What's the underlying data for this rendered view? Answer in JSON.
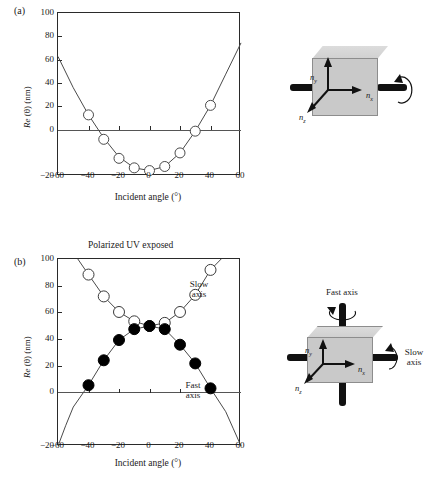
{
  "figure": {
    "panel_a_letter": "(a)",
    "panel_b_letter": "(b)",
    "panel_b_title": "Polarized UV exposed"
  },
  "chart_data": [
    {
      "type": "scatter",
      "panel": "(a)",
      "title": "",
      "xlabel": "Incident angle (°)",
      "ylabel": "Re (θ) (nm)",
      "xlim": [
        -60,
        60
      ],
      "ylim": [
        -20,
        100
      ],
      "xticks": [
        -60,
        -40,
        -20,
        0,
        20,
        40,
        60
      ],
      "yticks": [
        -20,
        0,
        20,
        40,
        60,
        80,
        100
      ],
      "grid": false,
      "legend": "none",
      "series": [
        {
          "name": "Unexposed retardation",
          "marker": "open-circle",
          "x": [
            -40,
            -30,
            -20,
            -10,
            0,
            10,
            20,
            30,
            40
          ],
          "values": [
            25,
            7,
            -7,
            -14,
            -16,
            -13,
            -3,
            13,
            32
          ]
        }
      ],
      "fit_curve": {
        "name": "parabolic fit",
        "x": [
          -60,
          -50,
          -40,
          -30,
          -20,
          -10,
          0,
          10,
          20,
          30,
          40,
          50,
          60
        ],
        "values": [
          68,
          45,
          25,
          8,
          -6,
          -14,
          -16,
          -13,
          -3,
          13,
          32,
          55,
          78
        ]
      }
    },
    {
      "type": "scatter",
      "panel": "(b)",
      "title": "Polarized UV exposed",
      "xlabel": "Incident angle (°)",
      "ylabel": "Re (θ) (nm)",
      "xlim": [
        -60,
        60
      ],
      "ylim": [
        -20,
        100
      ],
      "xticks": [
        -60,
        -40,
        -20,
        0,
        20,
        40,
        60
      ],
      "yticks": [
        -20,
        0,
        20,
        40,
        60,
        80,
        100
      ],
      "grid": false,
      "legend": "inline-annotations",
      "annotations": [
        {
          "text": "Slow\naxis",
          "x": 28,
          "y": 86
        },
        {
          "text": "Fast\naxis",
          "x": 27,
          "y": 22
        }
      ],
      "series": [
        {
          "name": "Slow axis",
          "marker": "open-circle",
          "x": [
            -40,
            -30,
            -20,
            -10,
            0,
            10,
            20,
            30,
            40
          ],
          "values": [
            90,
            76,
            66,
            60,
            57,
            59,
            66,
            77,
            93
          ]
        },
        {
          "name": "Fast axis",
          "marker": "filled-circle",
          "x": [
            -40,
            -30,
            -20,
            -10,
            0,
            10,
            20,
            30,
            40
          ],
          "values": [
            19,
            35,
            48,
            55,
            57,
            55,
            45,
            33,
            17
          ]
        }
      ],
      "fit_curves": [
        {
          "name": "Slow axis fit",
          "x": [
            -47,
            -40,
            -30,
            -20,
            -10,
            0,
            10,
            20,
            30,
            40,
            47
          ],
          "values": [
            100,
            90,
            76,
            66,
            60,
            57,
            59,
            66,
            77,
            93,
            100
          ]
        },
        {
          "name": "Fast axis fit",
          "x": [
            -60,
            -55,
            -50,
            -40,
            -30,
            -20,
            -10,
            0,
            10,
            20,
            30,
            40,
            50,
            55,
            60
          ],
          "values": [
            -20,
            -7,
            5,
            19,
            35,
            48,
            55,
            57,
            55,
            45,
            33,
            17,
            2,
            -9,
            -20
          ]
        }
      ]
    }
  ],
  "diagram_a": {
    "name": "unexposed-film-axes",
    "axis_labels": [
      "n_y",
      "n_x",
      "n_z"
    ],
    "n_y": "n",
    "n_y_sub": "y",
    "n_x": "n",
    "n_x_sub": "x",
    "n_z": "n",
    "n_z_sub": "z",
    "rotation": "rotation-arrow"
  },
  "diagram_b": {
    "name": "exposed-film-axes",
    "fast_axis_label": "Fast axis",
    "slow_axis_label": "Slow\naxis",
    "slow_axis_line1": "Slow",
    "slow_axis_line2": "axis",
    "n_y": "n",
    "n_y_sub": "y",
    "n_x": "n",
    "n_x_sub": "x",
    "n_z": "n",
    "n_z_sub": "z"
  },
  "axes_text": {
    "xlabel": "Incident angle (°)",
    "ylabel_italic": "Re",
    "ylabel_theta": " (θ) ",
    "ylabel_unit": "(nm)",
    "ytick_100": "100",
    "ytick_80": "80",
    "ytick_60": "60",
    "ytick_40": "40",
    "ytick_20": "20",
    "ytick_0": "0",
    "ytick_m20": "−20",
    "xtick_m60": "−60",
    "xtick_m40": "−40",
    "xtick_m20": "−20",
    "xtick_0": "0",
    "xtick_20": "20",
    "xtick_40": "40",
    "xtick_60": "60"
  },
  "annotations_b": {
    "slow_line1": "Slow",
    "slow_line2": "axis",
    "fast_line1": "Fast",
    "fast_line2": "axis"
  },
  "colors": {
    "axis": "#2a2a2a",
    "curve": "#4a4a4a",
    "marker_open_stroke": "#4a4a4a",
    "marker_filled": "#000000",
    "cube_front": "#c9c9c9",
    "cube_top": "#d8d8d8",
    "bar": "#111111"
  }
}
